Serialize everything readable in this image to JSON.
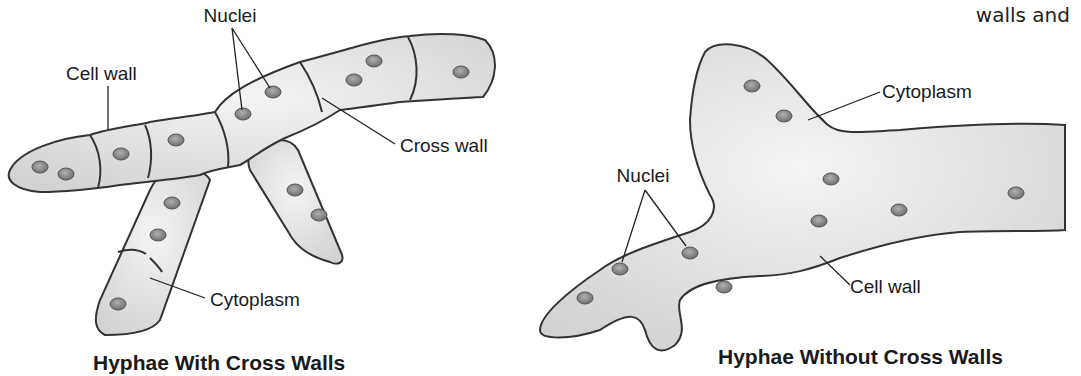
{
  "corner_text": "walls and",
  "left_diagram": {
    "title": "Hyphae With Cross Walls",
    "labels": {
      "nuclei": "Nuclei",
      "cell_wall": "Cell wall",
      "cross_wall": "Cross wall",
      "cytoplasm": "Cytoplasm"
    }
  },
  "right_diagram": {
    "title": "Hyphae Without Cross Walls",
    "labels": {
      "nuclei": "Nuclei",
      "cytoplasm": "Cytoplasm",
      "cell_wall": "Cell wall"
    }
  },
  "colors": {
    "cell_fill": "#e6e6e6",
    "outline": "#333333",
    "nucleus": "#8a8a8a"
  }
}
